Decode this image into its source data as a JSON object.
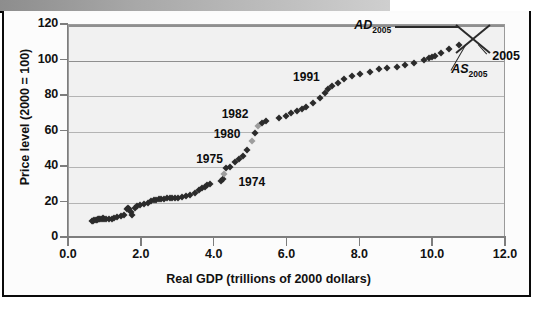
{
  "figure": {
    "background_color": "#fcfcfc",
    "plot_background_color": "#f1f1f1",
    "gridline_color": "#b4b4b4",
    "marker_color": "#2b2b2b"
  },
  "chart_data": {
    "type": "scatter",
    "title": "",
    "xlabel": "Real GDP (trillions of 2000 dollars)",
    "ylabel": "Price level (2000 = 100)",
    "xlim": [
      0.0,
      12.0
    ],
    "ylim": [
      0,
      120
    ],
    "xticks": [
      "0.0",
      "2.0",
      "4.0",
      "6.0",
      "8.0",
      "10.0",
      "12.0"
    ],
    "xtick_values": [
      0.0,
      2.0,
      4.0,
      6.0,
      8.0,
      10.0,
      12.0
    ],
    "yticks": [
      "0",
      "20",
      "40",
      "60",
      "80",
      "100",
      "120"
    ],
    "ytick_values": [
      0,
      20,
      40,
      60,
      80,
      100,
      120
    ],
    "grid": true,
    "legend": "none",
    "x": [
      0.62,
      0.66,
      0.7,
      0.74,
      0.78,
      0.8,
      0.83,
      0.86,
      0.9,
      0.93,
      0.97,
      1.02,
      1.1,
      1.18,
      1.24,
      1.33,
      1.44,
      1.52,
      1.58,
      1.62,
      1.66,
      1.7,
      1.74,
      1.8,
      1.86,
      1.96,
      2.06,
      2.16,
      2.26,
      2.33,
      2.4,
      2.47,
      2.54,
      2.61,
      2.68,
      2.76,
      2.84,
      2.92,
      3.0,
      3.1,
      3.2,
      3.32,
      3.46,
      3.58,
      3.66,
      3.74,
      3.8,
      3.86,
      4.18,
      4.22,
      4.26,
      4.3,
      4.42,
      4.56,
      4.66,
      4.78,
      4.88,
      5.02,
      5.12,
      5.18,
      5.3,
      5.42,
      5.78,
      5.96,
      6.1,
      6.26,
      6.4,
      6.52,
      6.7,
      6.88,
      7.02,
      7.1,
      7.22,
      7.4,
      7.56,
      7.78,
      8.0,
      8.26,
      8.5,
      8.72,
      9.0,
      9.24,
      9.48,
      9.76,
      9.88,
      9.96,
      10.06,
      10.22,
      10.44,
      10.7
    ],
    "y": [
      9.5,
      9.8,
      10.0,
      10.2,
      10.4,
      10.6,
      10.8,
      10.5,
      10.9,
      11.2,
      10.6,
      10.8,
      10.6,
      10.9,
      11.2,
      11.8,
      12.4,
      12.8,
      16.6,
      17.0,
      16.2,
      14.8,
      13.0,
      16.8,
      17.8,
      18.6,
      19.4,
      20.0,
      20.6,
      21.2,
      21.6,
      21.9,
      22.1,
      22.2,
      22.3,
      22.4,
      22.5,
      22.5,
      22.6,
      23.0,
      23.4,
      24.2,
      25.6,
      27.0,
      28.0,
      29.0,
      29.8,
      30.5,
      32.0,
      33.2,
      36.0,
      39.5,
      40.0,
      42.8,
      44.5,
      46.4,
      49.8,
      54.6,
      59.4,
      63.2,
      64.8,
      66.0,
      67.6,
      68.8,
      70.2,
      71.4,
      72.6,
      73.6,
      75.8,
      78.8,
      81.8,
      83.8,
      85.6,
      87.4,
      89.6,
      91.2,
      92.6,
      93.8,
      95.0,
      95.6,
      96.4,
      97.4,
      98.4,
      100.4,
      101.2,
      101.8,
      102.6,
      104.0,
      106.4,
      109.0
    ],
    "annotations": [
      {
        "label": "1974",
        "x": 4.3,
        "y": 33.2,
        "label_x": 4.68,
        "label_y": 30.5
      },
      {
        "label": "1975",
        "x": 4.3,
        "y": 39.5,
        "label_x": 3.52,
        "label_y": 43.5
      },
      {
        "label": "1980",
        "x": 5.02,
        "y": 54.6,
        "label_x": 4.0,
        "label_y": 57.5
      },
      {
        "label": "1982",
        "x": 5.18,
        "y": 63.2,
        "label_x": 4.22,
        "label_y": 69.0
      },
      {
        "label": "1991",
        "x": 7.1,
        "y": 83.8,
        "label_x": 6.18,
        "label_y": 89.5
      }
    ],
    "ad_as": {
      "equilibrium_x": 11.1,
      "equilibrium_y": 112.5,
      "ad_label": "AD",
      "ad_subscript": "2005",
      "as_label": "AS",
      "as_subscript": "2005",
      "equilibrium_label": "2005"
    }
  }
}
